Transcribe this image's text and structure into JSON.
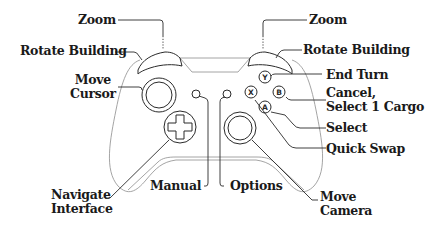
{
  "labels": {
    "zoom_left": "Zoom",
    "zoom_right": "Zoom",
    "rotate_left": "Rotate Building",
    "rotate_right": "Rotate Building",
    "move_cursor_1": "Move",
    "move_cursor_2": "Cursor",
    "end_turn": "End Turn",
    "cancel_1": "Cancel,",
    "cancel_2": "Select 1 Cargo",
    "select": "Select",
    "quick_swap": "Quick Swap",
    "navigate_1": "Navigate",
    "navigate_2": "Interface",
    "manual": "Manual",
    "options": "Options",
    "move_camera_1": "Move",
    "move_camera_2": "Camera"
  },
  "buttons": {
    "y": "Y",
    "x": "X",
    "b": "B",
    "a": "A"
  },
  "colors": {
    "text": "#1a1a1a",
    "controller_outline": "#9a9a9a",
    "button_outline": "#2a2a2a",
    "background": "#ffffff"
  }
}
